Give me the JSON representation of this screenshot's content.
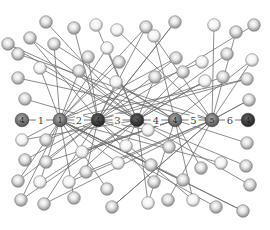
{
  "diagram": {
    "title": "",
    "colors": {
      "background": "#ffffff",
      "edge": "#6e6e6e",
      "outer_node_fill": "#c8c8c8",
      "outer_node_highlight": "#f4f4f4",
      "outer_node_stroke": "#7a7a7a",
      "chain_light": "#8a8a8a",
      "chain_dark": "#3a3a3a"
    },
    "chain": {
      "nodes": [
        {
          "id": "c0",
          "x": 22,
          "y": 120,
          "shade": "#6a6a6a",
          "label": "4"
        },
        {
          "id": "c1",
          "x": 60,
          "y": 120,
          "shade": "#7f7f7f",
          "label": "1"
        },
        {
          "id": "c2",
          "x": 98,
          "y": 120,
          "shade": "#3a3a3a",
          "label": "4"
        },
        {
          "id": "c3",
          "x": 137,
          "y": 120,
          "shade": "#2e2e2e",
          "label": "3"
        },
        {
          "id": "c4",
          "x": 175,
          "y": 120,
          "shade": "#7a7a7a",
          "label": "4"
        },
        {
          "id": "c5",
          "x": 212,
          "y": 120,
          "shade": "#707070",
          "label": "5"
        },
        {
          "id": "c6",
          "x": 248,
          "y": 120,
          "shade": "#3c3c3c",
          "label": "4"
        }
      ],
      "edge_labels": [
        "1",
        "2",
        "3",
        "4",
        "5",
        "6"
      ]
    },
    "outer_nodes": [
      [
        46,
        22
      ],
      [
        74,
        28
      ],
      [
        96,
        25
      ],
      [
        117,
        30
      ],
      [
        30,
        38
      ],
      [
        54,
        44
      ],
      [
        88,
        57
      ],
      [
        107,
        48
      ],
      [
        119,
        62
      ],
      [
        18,
        54
      ],
      [
        40,
        68
      ],
      [
        79,
        71
      ],
      [
        116,
        82
      ],
      [
        18,
        78
      ],
      [
        25,
        99
      ],
      [
        146,
        27
      ],
      [
        175,
        22
      ],
      [
        214,
        25
      ],
      [
        236,
        32
      ],
      [
        254,
        25
      ],
      [
        8,
        44
      ],
      [
        176,
        58
      ],
      [
        202,
        62
      ],
      [
        227,
        54
      ],
      [
        252,
        60
      ],
      [
        155,
        77
      ],
      [
        183,
        72
      ],
      [
        205,
        81
      ],
      [
        223,
        77
      ],
      [
        247,
        79
      ],
      [
        249,
        100
      ],
      [
        154,
        36
      ],
      [
        22,
        140
      ],
      [
        46,
        140
      ],
      [
        25,
        160
      ],
      [
        46,
        162
      ],
      [
        18,
        181
      ],
      [
        40,
        182
      ],
      [
        69,
        182
      ],
      [
        21,
        200
      ],
      [
        44,
        204
      ],
      [
        74,
        198
      ],
      [
        82,
        152
      ],
      [
        86,
        172
      ],
      [
        107,
        189
      ],
      [
        118,
        163
      ],
      [
        112,
        207
      ],
      [
        126,
        146
      ],
      [
        169,
        147
      ],
      [
        151,
        165
      ],
      [
        154,
        182
      ],
      [
        201,
        168
      ],
      [
        221,
        163
      ],
      [
        247,
        143
      ],
      [
        246,
        166
      ],
      [
        250,
        185
      ],
      [
        183,
        180
      ],
      [
        148,
        203
      ],
      [
        168,
        200
      ],
      [
        193,
        200
      ],
      [
        216,
        207
      ],
      [
        243,
        211
      ],
      [
        148,
        130
      ]
    ],
    "edges": [
      [
        0,
        1
      ],
      [
        1,
        2
      ],
      [
        2,
        3
      ],
      [
        3,
        4
      ],
      [
        4,
        5
      ],
      [
        5,
        6
      ]
    ]
  }
}
